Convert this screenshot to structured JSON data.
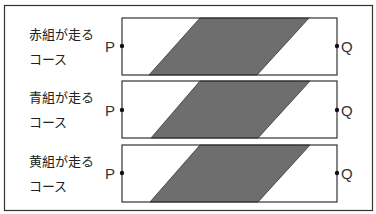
{
  "diagram": {
    "frame": {
      "x": 4,
      "y": 5,
      "w": 369,
      "h": 206
    },
    "colors": {
      "stroke": "#333333",
      "fill": "#6e6e6e",
      "background": "#ffffff"
    },
    "start_label": "P",
    "end_label": "Q",
    "courses": [
      {
        "label_line1": "赤組が走る",
        "label_line2": "コース",
        "box": {
          "x": 122,
          "y": 18,
          "w": 215,
          "h": 57
        },
        "shaded": {
          "top_left": 200,
          "top_right": 309,
          "bottom_left": 149,
          "bottom_right": 257
        }
      },
      {
        "label_line1": "青組が走る",
        "label_line2": "コース",
        "box": {
          "x": 122,
          "y": 81,
          "w": 215,
          "h": 57
        },
        "shaded": {
          "top_left": 200,
          "top_right": 310,
          "bottom_left": 151,
          "bottom_right": 258
        }
      },
      {
        "label_line1": "黄組が走る",
        "label_line2": "コース",
        "box": {
          "x": 122,
          "y": 145,
          "w": 215,
          "h": 57
        },
        "shaded": {
          "top_left": 200,
          "top_right": 310,
          "bottom_left": 150,
          "bottom_right": 258
        }
      }
    ]
  }
}
